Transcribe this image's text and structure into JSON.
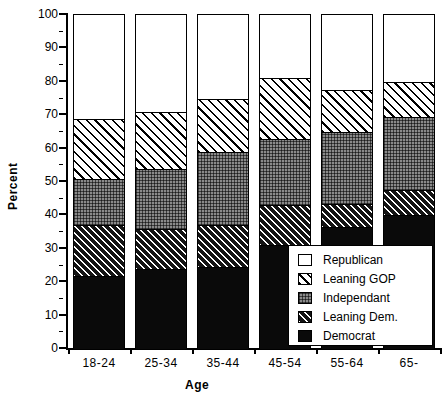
{
  "chart_data": {
    "type": "bar",
    "subtype": "stacked-bar",
    "title": "",
    "xlabel": "Age",
    "ylabel": "Percent",
    "ylim": [
      0,
      100
    ],
    "ytick_step": 10,
    "yticks": [
      0,
      10,
      20,
      30,
      40,
      50,
      60,
      70,
      80,
      90,
      100
    ],
    "ytick_labels": [
      "0",
      "10",
      "20",
      "30",
      "40",
      "50",
      "60",
      "70",
      "80",
      "90",
      "100"
    ],
    "grid": false,
    "legend_position": "inside-lower-right",
    "categories": [
      "18-24",
      "25-34",
      "35-44",
      "45-54",
      "55-64",
      "65-"
    ],
    "series": [
      {
        "name": "Democrat",
        "values": [
          22,
          24,
          24.5,
          31,
          36.5,
          40
        ]
      },
      {
        "name": "Leaning Dem.",
        "values": [
          15,
          12,
          12.5,
          12,
          7,
          7.5
        ]
      },
      {
        "name": "Independant",
        "values": [
          14,
          18,
          22,
          20,
          21.5,
          22
        ]
      },
      {
        "name": "Leaning GOP",
        "values": [
          18,
          17,
          16,
          18,
          12.5,
          10.5
        ]
      },
      {
        "name": "Republican",
        "values": [
          31,
          29,
          25,
          19,
          22.5,
          20
        ]
      }
    ],
    "cumulative_tops": [
      [
        22,
        37,
        51,
        69,
        100
      ],
      [
        24,
        36,
        54,
        71,
        100
      ],
      [
        24.5,
        37,
        59,
        75,
        100
      ],
      [
        31,
        43,
        63,
        81,
        100
      ],
      [
        36.5,
        43.5,
        65,
        77.5,
        100
      ],
      [
        40,
        47.5,
        69.5,
        80,
        100
      ]
    ]
  },
  "legend": {
    "items": [
      {
        "label": "Republican",
        "pattern": "solid-white"
      },
      {
        "label": "Leaning GOP",
        "pattern": "diagonal-hatch-coarse"
      },
      {
        "label": "Independant",
        "pattern": "dotted-gray"
      },
      {
        "label": "Leaning Dem.",
        "pattern": "diagonal-hatch-fine-dark"
      },
      {
        "label": "Democrat",
        "pattern": "solid-black"
      }
    ]
  },
  "colors": {
    "axis": "#000000",
    "republican": "#ffffff",
    "leaning_gop": "#ffffff",
    "independant": "#8a8a8a",
    "leaning_dem": "#1a1a1a",
    "democrat": "#0a0a0a"
  }
}
